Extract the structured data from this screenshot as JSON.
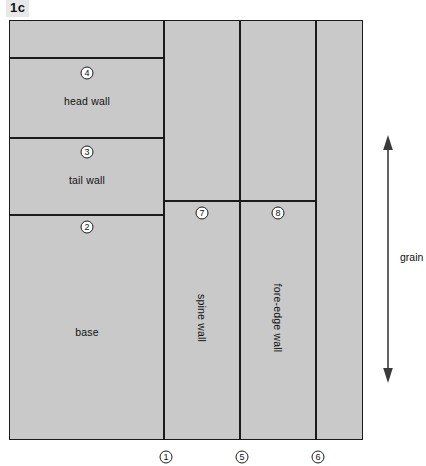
{
  "figure": {
    "label": "1c",
    "background_color": "#ffffff",
    "panel_fill": "#c9c9c9",
    "stroke_color": "#1b1b1b"
  },
  "panels": [
    {
      "name": "top-strip",
      "label": "",
      "callout": ""
    },
    {
      "name": "head-wall",
      "label": "head wall",
      "callout": "4"
    },
    {
      "name": "tail-wall",
      "label": "tail wall",
      "callout": "3"
    },
    {
      "name": "base",
      "label": "base",
      "callout": "2"
    },
    {
      "name": "left-tall-strip",
      "label": "",
      "callout": ""
    },
    {
      "name": "spine-wall",
      "label": "spine wall",
      "callout": "7"
    },
    {
      "name": "fore-edge-wall",
      "label": "fore-edge wall",
      "callout": "8"
    },
    {
      "name": "right-strip",
      "label": "",
      "callout": ""
    }
  ],
  "bottom_callouts": [
    {
      "name": "callout-1",
      "value": "1"
    },
    {
      "name": "callout-5",
      "value": "5"
    },
    {
      "name": "callout-6",
      "value": "6"
    }
  ],
  "grain": {
    "label": "grain",
    "direction": "vertical",
    "arrowheads": "both"
  }
}
